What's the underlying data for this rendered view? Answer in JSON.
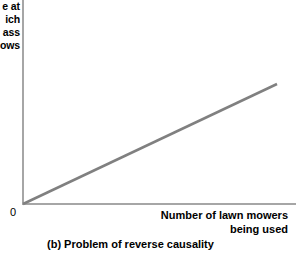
{
  "figure": {
    "caption": "(b) Problem of reverse causality",
    "origin_label": "0"
  },
  "axes": {
    "y_title_lines": [
      "e at",
      "ich",
      "ass",
      "ows"
    ],
    "y_title_full": "Rate at which grass grows",
    "y_title_clipped": true,
    "x_title_lines": [
      "Number of lawn mowers",
      "being used"
    ],
    "x_title_full": "Number of lawn mowers being used",
    "axis_color": "#a6a6a6"
  },
  "chart_data": {
    "type": "line",
    "title": "(b) Problem of reverse causality",
    "xlabel": "Number of lawn mowers being used",
    "ylabel": "Rate at which grass grows",
    "grid": false,
    "legend": "none",
    "xlim": [
      0,
      100
    ],
    "ylim": [
      0,
      100
    ],
    "tick_labels": {
      "x": [],
      "y": [],
      "origin": "0"
    },
    "series": [
      {
        "name": "Positive linear relationship",
        "color": "#808080",
        "line_width": 2.5,
        "x": [
          0,
          100
        ],
        "values": [
          0,
          59
        ]
      }
    ],
    "annotations": [
      {
        "text": "0",
        "x": 0,
        "y": 0,
        "note": "origin marker placed below-left of axis corner"
      }
    ]
  }
}
